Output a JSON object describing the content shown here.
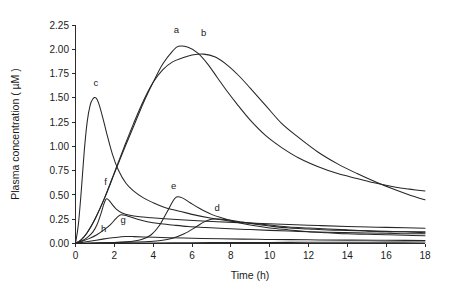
{
  "chart_data": {
    "type": "line",
    "title": "",
    "xlabel": "Time (h)",
    "ylabel": "Plasma concentration ( µM )",
    "xlim": [
      0,
      18
    ],
    "ylim": [
      0.0,
      2.25
    ],
    "xticks": [
      0,
      2,
      4,
      6,
      8,
      10,
      12,
      14,
      16,
      18
    ],
    "xticklabels": [
      "0",
      "2",
      "4",
      "6",
      "8",
      "10",
      "12",
      "14",
      "16",
      "18"
    ],
    "yticks": [
      0.0,
      0.25,
      0.5,
      0.75,
      1.0,
      1.25,
      1.5,
      1.75,
      2.0,
      2.25
    ],
    "yticklabels": [
      "0.00",
      "0.25",
      "0.50",
      "0.75",
      "1.00",
      "1.25",
      "1.50",
      "1.75",
      "2.00",
      "2.25"
    ],
    "grid": false,
    "legend_position": "inline-curve-labels",
    "line_color": "#262626",
    "series": [
      {
        "name": "a",
        "label": "a",
        "label_x": 5.2,
        "label_y": 2.17,
        "peak_time": 5.3,
        "peak_value": 2.03,
        "x": [
          0,
          0.3,
          0.6,
          1.0,
          1.5,
          2.0,
          2.5,
          3.0,
          3.5,
          4.0,
          4.5,
          5.0,
          5.3,
          5.8,
          6.3,
          6.8,
          7.3,
          7.8,
          8.3,
          9.0,
          9.8,
          10.6,
          11.5,
          12.5,
          13.5,
          14.5,
          15.5,
          16.5,
          17.2,
          18.0
        ],
        "y": [
          0.0,
          0.04,
          0.11,
          0.25,
          0.47,
          0.72,
          0.97,
          1.21,
          1.45,
          1.66,
          1.85,
          1.98,
          2.03,
          2.02,
          1.96,
          1.85,
          1.71,
          1.57,
          1.44,
          1.27,
          1.11,
          0.99,
          0.88,
          0.79,
          0.72,
          0.67,
          0.62,
          0.58,
          0.56,
          0.54
        ]
      },
      {
        "name": "b",
        "label": "b",
        "label_x": 6.6,
        "label_y": 2.14,
        "peak_time": 6.6,
        "peak_value": 1.95,
        "x": [
          0,
          0.3,
          0.6,
          1.0,
          1.5,
          2.0,
          2.5,
          3.0,
          3.5,
          4.0,
          4.5,
          5.0,
          5.5,
          6.0,
          6.6,
          7.2,
          7.8,
          8.4,
          9.0,
          9.8,
          10.6,
          11.5,
          12.5,
          13.5,
          14.5,
          15.5,
          16.5,
          17.2,
          18.0
        ],
        "y": [
          0.0,
          0.04,
          0.11,
          0.25,
          0.47,
          0.73,
          0.99,
          1.24,
          1.47,
          1.66,
          1.79,
          1.87,
          1.91,
          1.94,
          1.95,
          1.92,
          1.84,
          1.73,
          1.6,
          1.42,
          1.24,
          1.09,
          0.94,
          0.82,
          0.72,
          0.63,
          0.55,
          0.5,
          0.45
        ]
      },
      {
        "name": "c",
        "label": "c",
        "label_x": 1.05,
        "label_y": 1.62,
        "peak_time": 1.05,
        "peak_value": 1.5,
        "x": [
          0,
          0.15,
          0.3,
          0.45,
          0.6,
          0.75,
          0.9,
          1.05,
          1.2,
          1.4,
          1.6,
          1.9,
          2.2,
          2.6,
          3.0,
          3.5,
          4.0,
          4.6,
          5.2,
          6.0,
          7.0,
          8.0,
          9.0,
          10.0,
          11.0,
          12.0,
          13.0,
          14.0,
          15.0,
          16.0,
          17.0,
          18.0
        ],
        "y": [
          0.0,
          0.2,
          0.55,
          0.95,
          1.25,
          1.42,
          1.49,
          1.5,
          1.44,
          1.3,
          1.14,
          0.92,
          0.76,
          0.62,
          0.54,
          0.47,
          0.42,
          0.37,
          0.34,
          0.3,
          0.26,
          0.23,
          0.21,
          0.19,
          0.17,
          0.16,
          0.15,
          0.14,
          0.13,
          0.12,
          0.12,
          0.11
        ]
      },
      {
        "name": "d",
        "label": "d",
        "label_x": 7.3,
        "label_y": 0.33,
        "peak_time": 7.0,
        "peak_value": 0.25,
        "x": [
          0,
          1.0,
          2.0,
          3.0,
          3.8,
          4.4,
          5.0,
          5.6,
          6.2,
          6.6,
          7.0,
          7.5,
          8.0,
          8.6,
          9.2,
          10.0,
          11.0,
          12.0,
          13.0,
          14.0,
          15.0,
          16.0,
          17.0,
          18.0
        ],
        "y": [
          0.0,
          0.005,
          0.01,
          0.015,
          0.02,
          0.03,
          0.055,
          0.1,
          0.17,
          0.22,
          0.25,
          0.25,
          0.24,
          0.22,
          0.2,
          0.18,
          0.16,
          0.15,
          0.14,
          0.135,
          0.13,
          0.125,
          0.12,
          0.12
        ]
      },
      {
        "name": "e",
        "label": "e",
        "label_x": 5.05,
        "label_y": 0.565,
        "peak_time": 5.2,
        "peak_value": 0.48,
        "x": [
          0,
          1.0,
          2.0,
          2.8,
          3.4,
          3.9,
          4.3,
          4.7,
          5.0,
          5.2,
          5.5,
          5.9,
          6.4,
          7.0,
          7.6,
          8.3,
          9.0,
          10.0,
          11.0,
          12.0,
          13.0,
          14.0,
          15.0,
          16.0,
          17.0,
          18.0
        ],
        "y": [
          0.0,
          0.005,
          0.01,
          0.02,
          0.04,
          0.09,
          0.18,
          0.32,
          0.43,
          0.48,
          0.47,
          0.42,
          0.36,
          0.3,
          0.26,
          0.22,
          0.19,
          0.16,
          0.14,
          0.12,
          0.11,
          0.1,
          0.095,
          0.09,
          0.085,
          0.08
        ]
      },
      {
        "name": "f",
        "label": "f",
        "label_x": 1.55,
        "label_y": 0.6,
        "peak_time": 1.62,
        "peak_value": 0.46,
        "x": [
          0,
          0.3,
          0.6,
          0.9,
          1.1,
          1.3,
          1.45,
          1.55,
          1.62,
          1.75,
          1.9,
          2.1,
          2.4,
          2.8,
          3.3,
          3.9,
          4.6,
          5.4,
          6.3,
          7.3,
          8.4,
          9.6,
          11.0,
          12.5,
          14.0,
          15.5,
          17.0,
          18.0
        ],
        "y": [
          0.0,
          0.025,
          0.06,
          0.12,
          0.19,
          0.3,
          0.4,
          0.45,
          0.46,
          0.44,
          0.4,
          0.355,
          0.315,
          0.29,
          0.275,
          0.265,
          0.255,
          0.245,
          0.235,
          0.225,
          0.215,
          0.205,
          0.195,
          0.185,
          0.175,
          0.168,
          0.162,
          0.158
        ]
      },
      {
        "name": "g",
        "label": "g",
        "label_x": 2.45,
        "label_y": 0.215,
        "peak_time": 2.35,
        "peak_value": 0.295,
        "x": [
          0,
          0.3,
          0.7,
          1.1,
          1.5,
          1.8,
          2.05,
          2.2,
          2.35,
          2.55,
          2.8,
          3.2,
          3.7,
          4.3,
          5.0,
          5.8,
          6.7,
          7.7,
          8.8,
          10.0,
          11.5,
          13.0,
          14.5,
          16.0,
          17.0,
          18.0
        ],
        "y": [
          0.0,
          0.02,
          0.05,
          0.09,
          0.145,
          0.195,
          0.25,
          0.28,
          0.295,
          0.29,
          0.275,
          0.25,
          0.225,
          0.205,
          0.19,
          0.175,
          0.165,
          0.155,
          0.145,
          0.135,
          0.125,
          0.115,
          0.11,
          0.105,
          0.1,
          0.1
        ]
      },
      {
        "name": "h",
        "label": "h",
        "label_x": 1.45,
        "label_y": 0.115,
        "peak_time": 2.6,
        "peak_value": 0.072,
        "x": [
          0,
          0.4,
          0.9,
          1.4,
          1.9,
          2.3,
          2.6,
          3.0,
          3.5,
          4.1,
          4.8,
          5.6,
          6.5,
          7.5,
          8.6,
          9.8,
          11.0,
          12.5,
          14.0,
          15.5,
          17.0,
          18.0
        ],
        "y": [
          0.0,
          0.012,
          0.028,
          0.045,
          0.06,
          0.068,
          0.072,
          0.071,
          0.068,
          0.064,
          0.06,
          0.056,
          0.052,
          0.048,
          0.045,
          0.042,
          0.04,
          0.037,
          0.035,
          0.033,
          0.032,
          0.031
        ]
      },
      {
        "name": "baseline",
        "label": "",
        "label_x": null,
        "label_y": null,
        "peak_time": null,
        "peak_value": null,
        "x": [
          0,
          2,
          4,
          6,
          8,
          10,
          12,
          14,
          16,
          18
        ],
        "y": [
          0.0,
          0.004,
          0.006,
          0.008,
          0.01,
          0.011,
          0.012,
          0.013,
          0.014,
          0.015
        ]
      }
    ]
  }
}
